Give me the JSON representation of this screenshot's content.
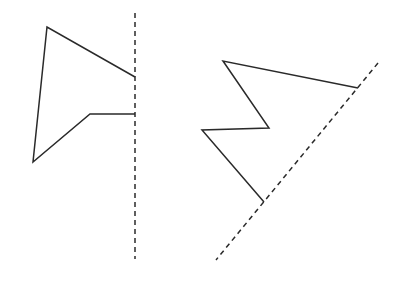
{
  "figure": {
    "width": 405,
    "height": 291,
    "stroke_color": "#2a2a2a",
    "background": "#ffffff"
  },
  "left_figure": {
    "mirror_line": {
      "x1": 135,
      "y1": 13,
      "x2": 135,
      "y2": 259
    },
    "shape_points": [
      [
        135,
        77
      ],
      [
        47,
        27
      ],
      [
        33,
        162
      ],
      [
        90,
        114
      ],
      [
        135,
        114
      ]
    ]
  },
  "right_figure": {
    "mirror_line": {
      "x1": 378,
      "y1": 63,
      "x2": 216,
      "y2": 260
    },
    "shape_points": [
      [
        358,
        88
      ],
      [
        223,
        61
      ],
      [
        269,
        128
      ],
      [
        202,
        130
      ],
      [
        264,
        202
      ]
    ]
  }
}
